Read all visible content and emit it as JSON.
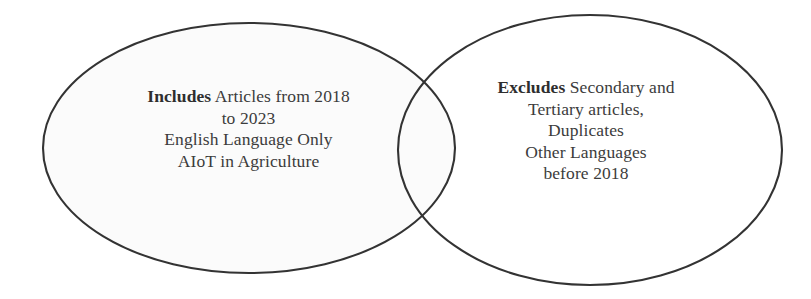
{
  "figure": {
    "name": "inclusion-exclusion-venn-diagram",
    "type": "venn-two-set",
    "background_color": "#ffffff",
    "stroke_color": "#333333",
    "stroke_width": 2,
    "text_color": "#3c3c3c",
    "left_fill": "#fbfbfb",
    "right_fill": "#ffffff"
  },
  "left_set": {
    "label": "Includes",
    "lead": "Includes",
    "lines": [
      {
        "lead": "Includes",
        "rest": " Articles from 2018"
      },
      {
        "lead": "",
        "rest": "to 2023"
      },
      {
        "lead": "",
        "rest": "English Language Only"
      },
      {
        "lead": "",
        "rest": "AIoT in Agriculture"
      }
    ],
    "criteria": [
      "Articles from 2018 to 2023",
      "English Language Only",
      "AIoT in Agriculture"
    ]
  },
  "right_set": {
    "label": "Excludes",
    "lead": "Excludes",
    "lines": [
      {
        "lead": "Excludes",
        "rest": " Secondary and"
      },
      {
        "lead": "",
        "rest": "Tertiary articles,"
      },
      {
        "lead": "",
        "rest": "Duplicates"
      },
      {
        "lead": "",
        "rest": "Other Languages"
      },
      {
        "lead": "",
        "rest": "before 2018"
      }
    ],
    "criteria": [
      "Secondary and Tertiary articles,",
      "Duplicates",
      "Other Languages",
      "before 2018"
    ]
  },
  "geometry": {
    "left_ellipse": {
      "cx": 249,
      "cy": 148,
      "rx": 206,
      "ry": 125
    },
    "right_ellipse": {
      "cx": 590,
      "cy": 150,
      "rx": 192,
      "ry": 135
    }
  }
}
